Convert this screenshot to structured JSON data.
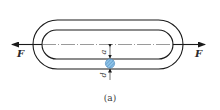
{
  "diagram": {
    "caption": "(a)",
    "force_left_label": "F",
    "force_right_label": "F",
    "dimension_inner_label": "a",
    "dimension_diameter_label": "d",
    "colors": {
      "stroke": "#1a1a1a",
      "rod_section_fill": "#8fc3e8",
      "rod_section_hatch": "#3f7fb5"
    }
  }
}
